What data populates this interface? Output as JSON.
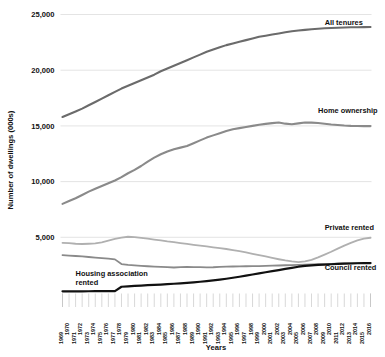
{
  "chart_data": {
    "type": "line",
    "title": "",
    "xlabel": "Years",
    "ylabel": "Number of dwellings (000s)",
    "ylim": [
      0,
      25000
    ],
    "yticks": [
      5000,
      10000,
      15000,
      20000,
      25000
    ],
    "ytick_labels": [
      "5,000",
      "10,000",
      "15,000",
      "20,000",
      "25,000"
    ],
    "grid": "horizontal",
    "legend_position": "inline-right",
    "x": [
      1969,
      1970,
      1971,
      1972,
      1973,
      1974,
      1975,
      1976,
      1977,
      1978,
      1979,
      1980,
      1981,
      1982,
      1983,
      1984,
      1985,
      1986,
      1987,
      1988,
      1989,
      1990,
      1991,
      1992,
      1993,
      1994,
      1995,
      1996,
      1997,
      1998,
      1999,
      2000,
      2001,
      2002,
      2003,
      2004,
      2005,
      2006,
      2007,
      2008,
      2009,
      2010,
      2011,
      2012,
      2013,
      2014,
      2015,
      2016
    ],
    "xtick_labels": [
      "1969",
      "1970",
      "1971",
      "1972",
      "1973",
      "1974",
      "1975",
      "1976",
      "1977",
      "1978",
      "1979",
      "1980",
      "1981",
      "1982",
      "1983",
      "1984",
      "1985",
      "1986",
      "1987",
      "1988",
      "1989",
      "1990",
      "1991",
      "1992",
      "1993",
      "1994",
      "1995",
      "1996",
      "1997",
      "1998",
      "1999",
      "2000",
      "2001",
      "2002",
      "2003",
      "2004",
      "2005",
      "2006",
      "2007",
      "2008",
      "2009",
      "2010",
      "2011",
      "2012",
      "2013",
      "2014",
      "2015",
      "2016"
    ],
    "series": [
      {
        "name": "All tenures",
        "color": "#6b6b6b",
        "width": 2.1,
        "label_x": 2009,
        "label_y": 24100,
        "label_anchor": "start",
        "values": [
          15800,
          16050,
          16300,
          16550,
          16850,
          17150,
          17450,
          17750,
          18050,
          18350,
          18600,
          18850,
          19100,
          19350,
          19600,
          19900,
          20150,
          20400,
          20650,
          20900,
          21150,
          21400,
          21650,
          21850,
          22050,
          22250,
          22400,
          22550,
          22700,
          22850,
          23000,
          23100,
          23200,
          23300,
          23400,
          23500,
          23560,
          23620,
          23680,
          23720,
          23760,
          23790,
          23810,
          23830,
          23850,
          23860,
          23870,
          23880
        ]
      },
      {
        "name": "Home ownership",
        "color": "#8a8a8a",
        "width": 2.1,
        "label_x": 2008,
        "label_y": 16150,
        "label_anchor": "start",
        "values": [
          8000,
          8250,
          8500,
          8800,
          9100,
          9350,
          9600,
          9850,
          10100,
          10400,
          10750,
          11050,
          11400,
          11800,
          12150,
          12450,
          12700,
          12900,
          13050,
          13200,
          13450,
          13700,
          13950,
          14150,
          14350,
          14550,
          14700,
          14800,
          14900,
          15000,
          15100,
          15180,
          15250,
          15300,
          15200,
          15150,
          15230,
          15300,
          15290,
          15260,
          15200,
          15130,
          15080,
          15030,
          15000,
          14990,
          14980,
          14980
        ]
      },
      {
        "name": "Private rented",
        "color": "#b0b0b0",
        "width": 1.8,
        "label_x": 2009,
        "label_y": 5700,
        "label_anchor": "start",
        "values": [
          4500,
          4480,
          4420,
          4400,
          4420,
          4450,
          4550,
          4700,
          4850,
          4980,
          5050,
          5020,
          4950,
          4880,
          4800,
          4720,
          4630,
          4560,
          4480,
          4400,
          4320,
          4250,
          4180,
          4100,
          4020,
          3950,
          3850,
          3750,
          3650,
          3520,
          3400,
          3280,
          3150,
          3030,
          2920,
          2830,
          2780,
          2830,
          2980,
          3200,
          3450,
          3700,
          3980,
          4250,
          4500,
          4720,
          4880,
          4960
        ]
      },
      {
        "name": "Council rented",
        "color": "#8a8a8a",
        "width": 1.8,
        "label_x": 2009,
        "label_y": 2050,
        "label_anchor": "start",
        "values": [
          3400,
          3360,
          3320,
          3280,
          3230,
          3180,
          3130,
          3080,
          3020,
          2600,
          2520,
          2480,
          2440,
          2400,
          2370,
          2350,
          2320,
          2290,
          2320,
          2340,
          2330,
          2320,
          2300,
          2310,
          2340,
          2360,
          2380,
          2390,
          2400,
          2410,
          2420,
          2430,
          2450,
          2470,
          2490,
          2510,
          2530,
          2550,
          2570,
          2590,
          2600,
          2620,
          2640,
          2660,
          2670,
          2680,
          2690,
          2700
        ]
      },
      {
        "name": "Housing association rented",
        "color": "#111111",
        "width": 2.2,
        "label_x": 1971,
        "label_y": 1500,
        "label_anchor": "start",
        "label_lines": [
          "Housing association",
          "rented"
        ],
        "values": [
          150,
          150,
          150,
          150,
          155,
          160,
          165,
          170,
          175,
          560,
          600,
          640,
          670,
          700,
          730,
          760,
          790,
          830,
          870,
          910,
          960,
          1010,
          1070,
          1130,
          1200,
          1280,
          1370,
          1460,
          1560,
          1660,
          1760,
          1860,
          1960,
          2060,
          2160,
          2260,
          2360,
          2430,
          2480,
          2520,
          2550,
          2580,
          2610,
          2630,
          2650,
          2670,
          2680,
          2690
        ]
      }
    ]
  },
  "axis": {
    "y_title": "Number of dwellings (000s)",
    "x_title": "Years"
  },
  "series_labels": {
    "all_tenures": "All tenures",
    "home_ownership": "Home ownership",
    "private_rented": "Private rented",
    "council_rented": "Council rented",
    "housing_association_line1": "Housing association",
    "housing_association_line2": "rented"
  },
  "colors": {
    "all_tenures": "#6b6b6b",
    "home_ownership": "#8a8a8a",
    "private_rented": "#b0b0b0",
    "council_rented": "#8a8a8a",
    "housing_association_rented": "#111111",
    "gridline": "#d8d8d8",
    "tickmark": "#bdbdbd",
    "text": "#111111",
    "background": "#ffffff"
  }
}
